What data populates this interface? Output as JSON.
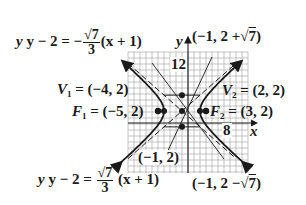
{
  "diagram": {
    "grid": {
      "cell_units": 1,
      "x_tick_label": "8",
      "y_tick_label": "12"
    },
    "axes": {
      "x_label": "x",
      "y_label": "y"
    },
    "center": {
      "label": "(−1, 2)",
      "x": -1,
      "y": 2
    },
    "vertices": [
      {
        "name": "V",
        "sub": "1",
        "label": "= (−4, 2)",
        "x": -4,
        "y": 2
      },
      {
        "name": "V",
        "sub": "2",
        "label": "= (2, 2)",
        "x": 2,
        "y": 2
      }
    ],
    "foci": [
      {
        "name": "F",
        "sub": "1",
        "label": "= (−5, 2)",
        "x": -5,
        "y": 2
      },
      {
        "name": "F",
        "sub": "2",
        "label": "= (3, 2)",
        "x": 3,
        "y": 2
      }
    ],
    "conjugate_points": [
      {
        "label_pre": "(−1, 2 +",
        "root": "7",
        "label_post": ")",
        "x": -1,
        "y": 4.6458
      },
      {
        "label_pre": "(−1, 2 −",
        "root": "7",
        "label_post": ")",
        "x": -1,
        "y": -0.6458
      }
    ],
    "asymptotes": [
      {
        "lhs": "y − 2 = −",
        "num": "√7",
        "den": "3",
        "rhs": "(x + 1)",
        "slope": -0.8819
      },
      {
        "lhs": "y − 2 =",
        "num": "√7",
        "den": "3",
        "rhs": "(x + 1)",
        "slope": 0.8819
      }
    ],
    "colors": {
      "ink": "#1a1a1a",
      "grid": "#9a9a9a",
      "background": "#ffffff"
    }
  }
}
